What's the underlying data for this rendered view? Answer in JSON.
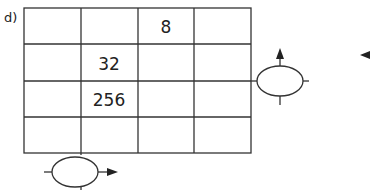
{
  "label": "d)",
  "grid": {
    "rows": 4,
    "cols": 4,
    "cells": [
      [
        "",
        "",
        "8",
        ""
      ],
      [
        "",
        "32",
        "",
        ""
      ],
      [
        "",
        "256",
        "",
        ""
      ],
      [
        "",
        "",
        "",
        ""
      ]
    ]
  },
  "colors": {
    "line": "#333333",
    "text": "#222222",
    "background": "#ffffff"
  },
  "shapes": {
    "right_operator": {
      "type": "ellipse",
      "arrow": "up",
      "icon": "ellipse-operator-icon"
    },
    "bottom_operator": {
      "type": "ellipse",
      "arrow": "right",
      "icon": "ellipse-operator-icon"
    },
    "edge_arrow": {
      "direction": "left",
      "icon": "arrow-left-icon"
    }
  }
}
